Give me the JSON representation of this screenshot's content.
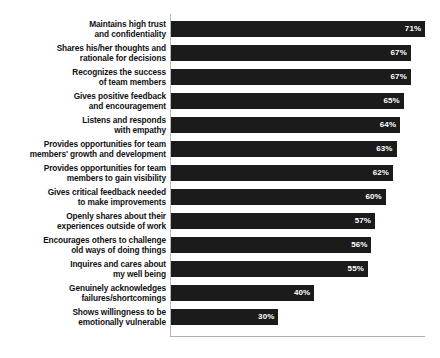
{
  "chart_data": {
    "type": "bar",
    "orientation": "horizontal",
    "title": "",
    "subtitle": "",
    "xlabel": "",
    "ylabel": "",
    "xlim": [
      0,
      71
    ],
    "grid": false,
    "legend": null,
    "value_suffix": "%",
    "bar_color": "#1b1b1b",
    "value_label_color": "#ffffff",
    "axis_color": "#b0b0b0",
    "background_color": "#ffffff",
    "categories": [
      "Maintains high trust\nand confidentiality",
      "Shares his/her thoughts and\nrationale for decisions",
      "Recognizes the success\nof team members",
      "Gives positive feedback\nand encouragement",
      "Listens and responds\nwith empathy",
      "Provides opportunities for team\nmembers' growth and development",
      "Provides opportunities for team\nmembers to gain visibility",
      "Gives critical feedback needed\nto make improvements",
      "Openly shares about their\nexperiences outside of work",
      "Encourages others to challenge\nold ways of doing things",
      "Inquires and cares about\nmy well being",
      "Genuinely acknowledges\nfailures/shortcomings",
      "Shows willingness to be\nemotionally vulnerable"
    ],
    "values": [
      71,
      67,
      67,
      65,
      64,
      63,
      62,
      60,
      57,
      56,
      55,
      40,
      30
    ],
    "value_labels": [
      "71%",
      "67%",
      "67%",
      "65%",
      "64%",
      "63%",
      "62%",
      "60%",
      "57%",
      "56%",
      "55%",
      "40%",
      "30%"
    ]
  }
}
